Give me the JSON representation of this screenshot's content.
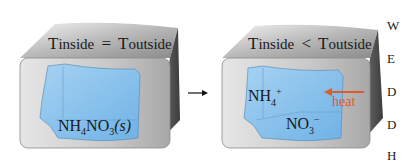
{
  "diagram": {
    "left_box": {
      "title_parts": {
        "t1": "T",
        "sub1": "inside",
        "op": "=",
        "t2": "T",
        "sub2": "outside"
      },
      "solid_label": {
        "base": "NH",
        "sub4": "4",
        "mid": "NO",
        "sub3": "3",
        "state": "(s)"
      }
    },
    "transition_arrow": "→",
    "right_box": {
      "title_parts": {
        "t1": "T",
        "sub1": "inside",
        "op": "<",
        "t2": "T",
        "sub2": "outside"
      },
      "cation_label": {
        "base": "NH",
        "sub": "4",
        "sup": "+"
      },
      "anion_label": {
        "base": "NO",
        "sub": "3",
        "sup": "−"
      },
      "heat_label": "heat"
    },
    "side_text_fragments": [
      "W",
      "E",
      "D",
      "D",
      "H"
    ],
    "colors": {
      "box_face": "#c8c8c8",
      "box_top": "#9a9a9a",
      "box_side": "#555555",
      "solution_blue": "#8cc4ee",
      "heat_arrow": "#e05a2a",
      "text": "#1a1a1a"
    }
  }
}
